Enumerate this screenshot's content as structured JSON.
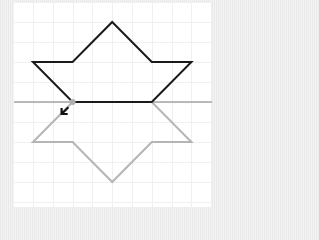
{
  "diagram": {
    "colors": {
      "original_shape": "#1a1a1a",
      "reflected_shape": "#b5b5b5",
      "mirror_line": "#7a7a7a",
      "grid": "#f0f0f0",
      "handle_point": "#b0b0b0",
      "arrow": "#111111"
    },
    "grid_unit": "1 square",
    "original_shape": {
      "label": "original",
      "vertices_grid": [
        [
          5,
          1
        ],
        [
          7,
          3
        ],
        [
          9,
          3
        ],
        [
          7,
          5
        ],
        [
          3,
          5
        ],
        [
          1,
          3
        ],
        [
          3,
          3
        ]
      ]
    },
    "mirror_line": {
      "label": "line of reflection",
      "orientation": "horizontal",
      "grid_y": 5
    },
    "reflected_shape": {
      "label": "image",
      "vertices_grid": [
        [
          3,
          5
        ],
        [
          1,
          7
        ],
        [
          3,
          7
        ],
        [
          5,
          9
        ],
        [
          7,
          7
        ],
        [
          9,
          7
        ],
        [
          7,
          5
        ]
      ]
    },
    "cursor": {
      "icon": "resize-arrow-icon",
      "direction": "down-left"
    }
  }
}
